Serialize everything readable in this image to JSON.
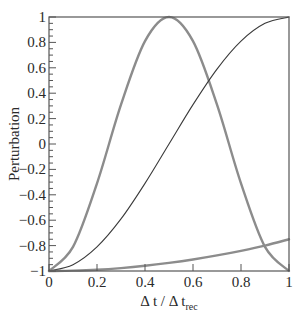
{
  "chart_data": {
    "type": "line",
    "title": "",
    "xlabel": "Δ t / Δ t_rec",
    "xlabel_parts": {
      "main": "Δ t / Δ t",
      "sub": "rec"
    },
    "ylabel": "Perturbation",
    "xlim": [
      0,
      1
    ],
    "ylim": [
      -1,
      1
    ],
    "x_ticks": [
      0,
      0.2,
      0.4,
      0.6,
      0.8,
      1
    ],
    "x_tick_labels": [
      "0",
      "0.2",
      "0.4",
      "0.6",
      "0.8",
      "1"
    ],
    "y_ticks": [
      -1,
      -0.8,
      -0.6,
      -0.4,
      -0.2,
      0,
      0.2,
      0.4,
      0.6,
      0.8,
      1
    ],
    "y_tick_labels": [
      "−1",
      "−0.8",
      "−0.6",
      "−0.4",
      "−0.2",
      "0",
      "0.2",
      "0.4",
      "0.6",
      "0.8",
      "1"
    ],
    "y_minor_step": 0.05,
    "grid": false,
    "legend": null,
    "series": [
      {
        "name": "thick gray bump",
        "color": "#8c8c8c",
        "width": 2.4,
        "x": [
          0,
          0.1,
          0.2,
          0.3,
          0.4,
          0.5,
          0.6,
          0.7,
          0.8,
          0.9,
          1.0
        ],
        "values": [
          -1,
          -0.81,
          -0.31,
          0.31,
          0.81,
          1,
          0.81,
          0.31,
          -0.31,
          -0.81,
          -1
        ]
      },
      {
        "name": "thin dark rise",
        "color": "#3a3a3a",
        "width": 1.1,
        "x": [
          0,
          0.1,
          0.2,
          0.3,
          0.4,
          0.5,
          0.6,
          0.7,
          0.8,
          0.9,
          1.0
        ],
        "values": [
          -1,
          -0.95,
          -0.81,
          -0.59,
          -0.31,
          0,
          0.31,
          0.59,
          0.81,
          0.95,
          1
        ]
      },
      {
        "name": "thick gray slow rise",
        "color": "#8c8c8c",
        "width": 2.4,
        "x": [
          0,
          0.1,
          0.2,
          0.3,
          0.4,
          0.5,
          0.6,
          0.7,
          0.8,
          0.9,
          1.0
        ],
        "values": [
          -1,
          -0.997,
          -0.99,
          -0.977,
          -0.959,
          -0.936,
          -0.909,
          -0.877,
          -0.841,
          -0.8,
          -0.75
        ]
      }
    ]
  }
}
